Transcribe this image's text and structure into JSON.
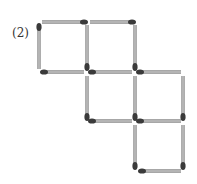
{
  "label": "(2)",
  "colors": {
    "stick": "#b4b4b4",
    "stick_edge": "#8a8a8a",
    "head": "#3a3a3a"
  },
  "matches": [
    {
      "x1": 42,
      "y1": 22,
      "x2": 84,
      "y2": 22,
      "head": "end"
    },
    {
      "x1": 90,
      "y1": 22,
      "x2": 132,
      "y2": 22,
      "head": "end"
    },
    {
      "x1": 39,
      "y1": 27,
      "x2": 39,
      "y2": 69,
      "head": "start"
    },
    {
      "x1": 87,
      "y1": 25,
      "x2": 87,
      "y2": 67,
      "head": "end"
    },
    {
      "x1": 135,
      "y1": 25,
      "x2": 135,
      "y2": 67,
      "head": "end"
    },
    {
      "x1": 44,
      "y1": 72,
      "x2": 84,
      "y2": 72,
      "head": "start"
    },
    {
      "x1": 92,
      "y1": 72,
      "x2": 132,
      "y2": 72,
      "head": "start"
    },
    {
      "x1": 140,
      "y1": 72,
      "x2": 181,
      "y2": 72,
      "head": "start"
    },
    {
      "x1": 87,
      "y1": 76,
      "x2": 87,
      "y2": 117,
      "head": "end"
    },
    {
      "x1": 135,
      "y1": 76,
      "x2": 135,
      "y2": 117,
      "head": "end"
    },
    {
      "x1": 183,
      "y1": 76,
      "x2": 183,
      "y2": 117,
      "head": "end"
    },
    {
      "x1": 92,
      "y1": 121,
      "x2": 132,
      "y2": 121,
      "head": "start"
    },
    {
      "x1": 140,
      "y1": 121,
      "x2": 181,
      "y2": 121,
      "head": "start"
    },
    {
      "x1": 135,
      "y1": 125,
      "x2": 135,
      "y2": 166,
      "head": "end"
    },
    {
      "x1": 183,
      "y1": 125,
      "x2": 183,
      "y2": 166,
      "head": "end"
    },
    {
      "x1": 142,
      "y1": 171,
      "x2": 181,
      "y2": 171,
      "head": "start"
    }
  ]
}
